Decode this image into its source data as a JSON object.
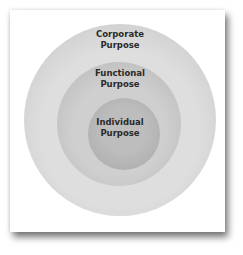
{
  "diagram": {
    "type": "concentric-circles",
    "layers": [
      {
        "line1": "Corporate",
        "line2": "Purpose",
        "color": "#d8d8d8"
      },
      {
        "line1": "Functional",
        "line2": "Purpose",
        "color": "#c6c6c6"
      },
      {
        "line1": "Individual",
        "line2": "Purpose",
        "color": "#b3b3b3"
      }
    ]
  }
}
